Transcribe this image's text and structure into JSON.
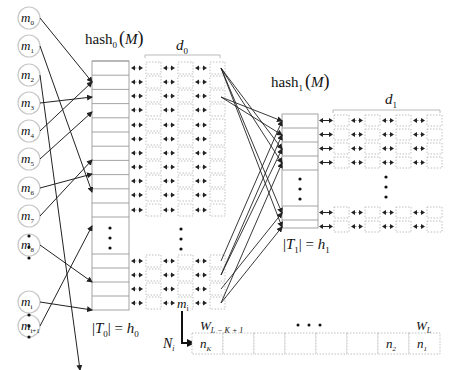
{
  "colors": {
    "line": "#222222",
    "box": "#9a9a9a",
    "dotted": "#b0b0b0",
    "circle": "#c8c8c8",
    "text": "#111111"
  },
  "labels": {
    "hash0": "hash",
    "hash0_sub": "0",
    "hash0_arg": "M",
    "hash1": "hash",
    "hash1_sub": "1",
    "hash1_arg": "M",
    "d0": "d",
    "d0_sub": "0",
    "d1": "d",
    "d1_sub": "1",
    "t0_eq": "|T",
    "t0_sub": "0",
    "t0_rhs": "| = h",
    "t0_rhs_sub": "0",
    "t1_eq": "|T",
    "t1_sub": "1",
    "t1_rhs": "| = h",
    "t1_rhs_sub": "1",
    "mi_chain": "m",
    "mi_chain_sub": "i",
    "Ni": "N",
    "Ni_sub": "i",
    "W_left": "W",
    "W_left_sub": "L − K + 1",
    "W_right": "W",
    "W_right_sub": "L",
    "window_dots": "• • •"
  },
  "messages": [
    {
      "name": "m",
      "sub": "0"
    },
    {
      "name": "m",
      "sub": "1"
    },
    {
      "name": "m",
      "sub": "2"
    },
    {
      "name": "m",
      "sub": "3"
    },
    {
      "name": "m",
      "sub": "4"
    },
    {
      "name": "m",
      "sub": "5"
    },
    {
      "name": "m",
      "sub": "6"
    },
    {
      "name": "m",
      "sub": "7"
    },
    {
      "name": "m",
      "sub": "8"
    },
    {
      "name": "m",
      "sub": "i"
    },
    {
      "name": "m",
      "sub": "i+1"
    }
  ],
  "window_cells": [
    {
      "name": "n",
      "sub": "K"
    },
    {
      "name": "",
      "sub": ""
    },
    {
      "name": "",
      "sub": ""
    },
    {
      "name": "",
      "sub": ""
    },
    {
      "name": "",
      "sub": ""
    },
    {
      "name": "",
      "sub": ""
    },
    {
      "name": "n",
      "sub": "2"
    },
    {
      "name": "n",
      "sub": "1"
    }
  ]
}
